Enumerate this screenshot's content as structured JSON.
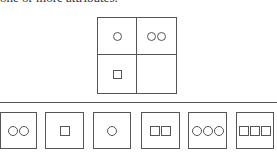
{
  "caption": "one or more attributes.",
  "matrix": {
    "cells": [
      {
        "shapes": [
          "circle"
        ]
      },
      {
        "shapes": [
          "circle",
          "circle"
        ]
      },
      {
        "shapes": [
          "square"
        ]
      },
      {
        "shapes": []
      }
    ]
  },
  "options": [
    {
      "left": 0,
      "width": 37,
      "shapes": [
        "circle",
        "circle"
      ]
    },
    {
      "left": 45,
      "width": 39,
      "shapes": [
        "square"
      ]
    },
    {
      "left": 93,
      "width": 38,
      "shapes": [
        "circle"
      ]
    },
    {
      "left": 141,
      "width": 39,
      "shapes": [
        "square",
        "square"
      ]
    },
    {
      "left": 188,
      "width": 39,
      "shapes": [
        "circle",
        "circle",
        "circle"
      ]
    },
    {
      "left": 236,
      "width": 38,
      "shapes": [
        "square",
        "square",
        "square"
      ]
    }
  ]
}
